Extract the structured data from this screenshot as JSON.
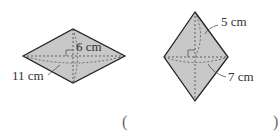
{
  "figure_left": {
    "shape": "rhombus",
    "label_half_diagonal": "6 cm",
    "label_side": "11 cm",
    "fill": "#c8c8c8",
    "stroke": "#222222"
  },
  "figure_right": {
    "shape": "rhombus",
    "label_half_diagonal": "5 cm",
    "label_side": "7 cm",
    "fill": "#c8c8c8",
    "stroke": "#222222"
  },
  "answer_blank": {
    "open_paren": "(",
    "close_paren": ")"
  }
}
